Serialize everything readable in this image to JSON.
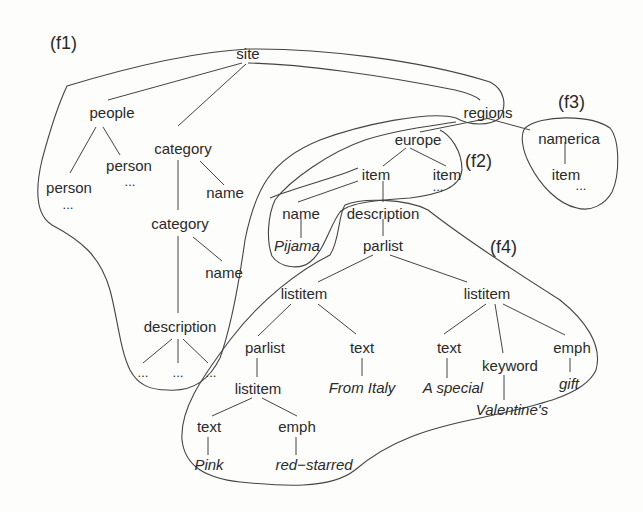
{
  "diagram": {
    "type": "xml-tree-fragments",
    "fragment_labels": {
      "f1": "(f1)",
      "f2": "(f2)",
      "f3": "(f3)",
      "f4": "(f4)"
    },
    "nodes": {
      "site": "site",
      "people": "people",
      "person_a": "person",
      "person_a_more": "...",
      "person_b": "person",
      "person_b_more": "...",
      "category_1": "category",
      "category_1_name": "name",
      "category_2": "category",
      "category_2_name": "name",
      "description_left": "description",
      "desc_left_more_1": "...",
      "desc_left_more_2": "...",
      "desc_left_more_3": "...",
      "regions": "regions",
      "namerica": "namerica",
      "namerica_item": "item",
      "namerica_item_more": "...",
      "europe": "europe",
      "europe_item_1": "item",
      "europe_item_2": "item",
      "europe_item_2_more": "...",
      "item_name": "name",
      "item_name_value": "Pijama",
      "item_description": "description",
      "parlist_top": "parlist",
      "listitem_left": "listitem",
      "listitem_right": "listitem",
      "parlist_inner": "parlist",
      "listitem_inner": "listitem",
      "text_pink": "text",
      "text_pink_value": "Pink",
      "emph_red": "emph",
      "emph_red_value": "red−starred",
      "text_italy": "text",
      "text_italy_value": "From Italy",
      "text_special": "text",
      "text_special_value": "A special",
      "keyword": "keyword",
      "keyword_value": "Valentine's",
      "emph_gift": "emph",
      "emph_gift_value": "gift"
    }
  }
}
